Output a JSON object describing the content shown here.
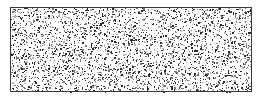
{
  "diagram": {
    "type": "material-hatch-swatch",
    "pattern": "stipple-speckle",
    "shape": "rectangle",
    "rect": {
      "x": 10,
      "y": 7,
      "width": 242,
      "height": 85
    },
    "colors": {
      "background": "#ffffff",
      "border": "#3a3a3a",
      "speckle_dark": "#2a2a2a",
      "speckle_mid": "#777777",
      "speckle_light": "#b5b5b5"
    },
    "speckle_density": 0.55,
    "seed": 1337
  }
}
